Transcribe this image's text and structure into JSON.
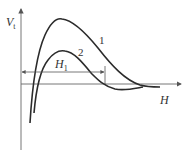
{
  "diagram": {
    "y_axis_label": "V",
    "y_axis_subscript": "t",
    "x_axis_label": "H",
    "interval_label": "H",
    "interval_subscript": "1",
    "curves": [
      {
        "id": "1",
        "label": "1",
        "description": "upper curve with higher peak, crosses axis further right"
      },
      {
        "id": "2",
        "label": "2",
        "description": "lower curve with smaller peak, dips slightly below axis"
      }
    ],
    "colors": {
      "line": "#333333",
      "axis": "#666666",
      "background": "#ffffff"
    }
  }
}
